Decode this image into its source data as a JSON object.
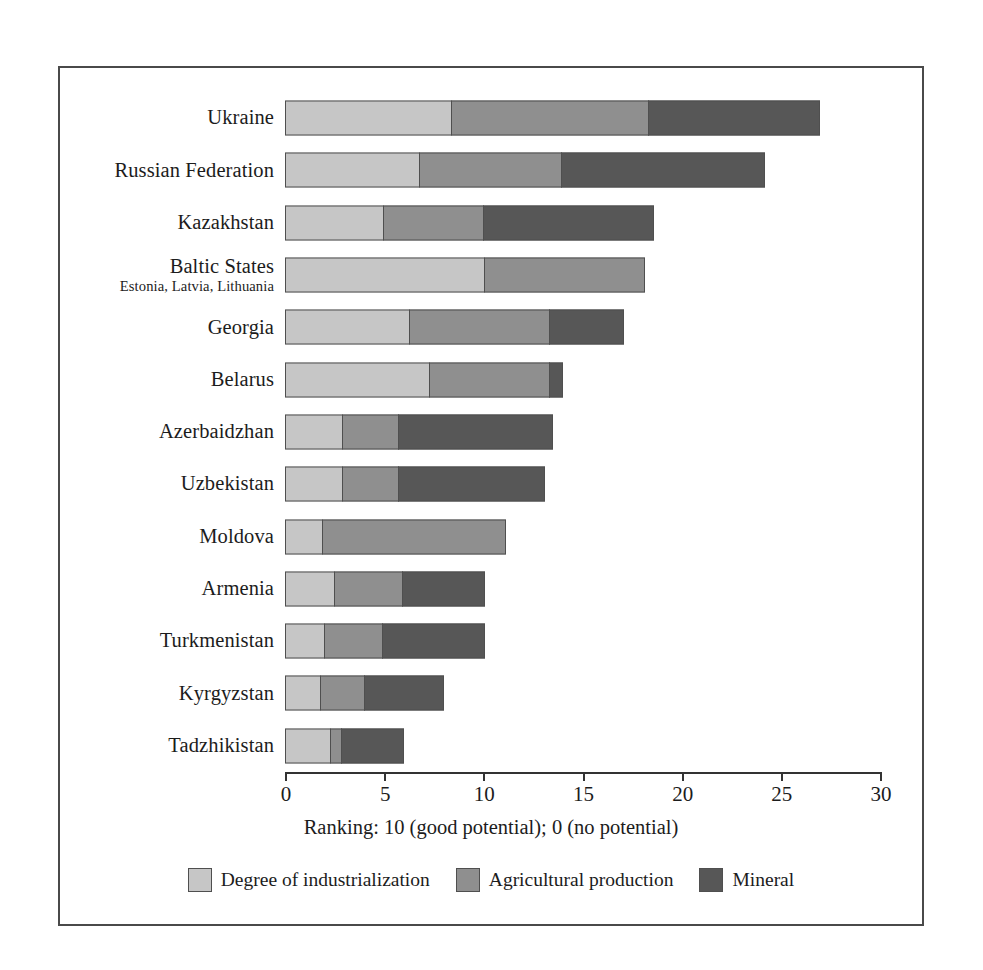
{
  "chart_data": {
    "type": "bar",
    "orientation": "horizontal",
    "stacked": true,
    "title": "",
    "xlabel": "Ranking: 10 (good potential); 0 (no potential)",
    "ylabel": "",
    "xlim": [
      0,
      30
    ],
    "xticks": [
      0,
      5,
      10,
      15,
      20,
      25,
      30
    ],
    "xtick_labels": [
      "0",
      "5",
      "10",
      "15",
      "20",
      "25",
      "30"
    ],
    "grid": false,
    "legend_position": "bottom",
    "categories": [
      "Ukraine",
      "Russian Federation",
      "Kazakhstan",
      "Baltic States",
      "Georgia",
      "Belarus",
      "Azerbaidzhan",
      "Uzbekistan",
      "Moldova",
      "Armenia",
      "Turkmenistan",
      "Kyrgyzstan",
      "Tadzhikistan"
    ],
    "category_sublabels": {
      "Baltic States": "Estonia, Latvia, Lithuania"
    },
    "series": [
      {
        "name": "Degree of industrialization",
        "color": "#c6c6c6",
        "values": [
          8.4,
          6.8,
          5.0,
          10.1,
          6.3,
          7.3,
          2.9,
          2.9,
          1.9,
          2.5,
          2.0,
          1.8,
          2.3
        ]
      },
      {
        "name": "Agricultural production",
        "color": "#8f8f8f",
        "values": [
          10.0,
          7.2,
          5.1,
          8.1,
          7.1,
          6.1,
          2.9,
          2.9,
          9.3,
          3.5,
          3.0,
          2.3,
          0.6
        ]
      },
      {
        "name": "Mineral",
        "color": "#575757",
        "values": [
          8.7,
          10.3,
          8.6,
          0.0,
          3.8,
          0.7,
          7.8,
          7.4,
          0.0,
          4.2,
          5.2,
          4.0,
          3.2
        ]
      }
    ],
    "totals": [
      27.1,
      24.3,
      18.7,
      18.2,
      17.2,
      14.1,
      13.6,
      13.2,
      11.2,
      10.2,
      10.2,
      8.1,
      6.1
    ]
  },
  "legend": {
    "items": [
      {
        "label": "Degree of industrialization",
        "color": "#c6c6c6"
      },
      {
        "label": "Agricultural production",
        "color": "#8f8f8f"
      },
      {
        "label": "Mineral",
        "color": "#575757"
      }
    ]
  }
}
